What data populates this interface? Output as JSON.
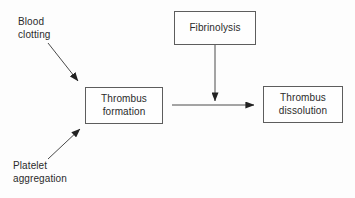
{
  "diagram": {
    "background_color": "#fdfdfd",
    "stroke_color": "#4a4a4a",
    "text_color": "#2b2b2b",
    "nodes": [
      {
        "id": "thrombus-formation",
        "shape": "rectangle",
        "lines": [
          "Thrombus",
          "formation"
        ],
        "line1": "Thrombus",
        "line2": "formation"
      },
      {
        "id": "fibrinolysis",
        "shape": "rectangle",
        "lines": [
          "Fibrinolysis"
        ],
        "line1": "Fibrinolysis",
        "line2": ""
      },
      {
        "id": "thrombus-dissolution",
        "shape": "rectangle",
        "lines": [
          "Thrombus",
          "dissolution"
        ],
        "line1": "Thrombus",
        "line2": "dissolution"
      }
    ],
    "labels": [
      {
        "id": "blood-clotting",
        "lines": [
          "Blood",
          "clotting"
        ],
        "line1": "Blood",
        "line2": "clotting"
      },
      {
        "id": "platelet-aggregation",
        "lines": [
          "Platelet",
          "aggregation"
        ],
        "line1": "Platelet",
        "line2": "aggregation"
      }
    ],
    "edges": [
      {
        "id": "blood-clotting-to-thrombus-formation",
        "from": "blood-clotting",
        "to": "thrombus-formation",
        "direction": "down-right",
        "arrowhead": "filled-triangle"
      },
      {
        "id": "platelet-aggregation-to-thrombus-formation",
        "from": "platelet-aggregation",
        "to": "thrombus-formation",
        "direction": "up-right",
        "arrowhead": "filled-triangle"
      },
      {
        "id": "fibrinolysis-to-transition",
        "from": "fibrinolysis",
        "to": "thrombus-formation-to-dissolution",
        "direction": "down",
        "arrowhead": "filled-triangle"
      },
      {
        "id": "thrombus-formation-to-thrombus-dissolution",
        "from": "thrombus-formation",
        "to": "thrombus-dissolution",
        "direction": "right",
        "arrowhead": "filled-triangle"
      }
    ]
  }
}
